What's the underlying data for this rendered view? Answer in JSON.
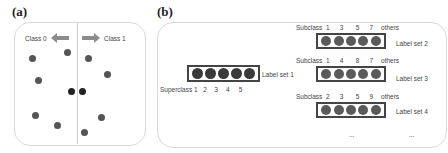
{
  "panel_a": {
    "label": "(a)",
    "class0_label": "Class 0",
    "class1_label": "Class 1",
    "arrow_left": "left-arrow",
    "arrow_right": "right-arrow",
    "points_left": 6,
    "points_right": 6,
    "boundary_points": 2
  },
  "panel_b": {
    "label": "(b)",
    "superclass": {
      "prefix": "Superclass",
      "numbers": [
        "1",
        "2",
        "3",
        "4",
        "5"
      ],
      "set_label": "Label set 1"
    },
    "subsets": [
      {
        "prefix": "Subclass",
        "numbers": [
          "1",
          "3",
          "5",
          "7",
          "others"
        ],
        "set_label": "Label set 2"
      },
      {
        "prefix": "Subclass",
        "numbers": [
          "1",
          "4",
          "8",
          "7",
          "others"
        ],
        "set_label": "Label set 3"
      },
      {
        "prefix": "Subclass",
        "numbers": [
          "2",
          "3",
          "5",
          "9",
          "others"
        ],
        "set_label": "Label set 4"
      }
    ],
    "ellipsis_1": "...",
    "ellipsis_2": "..."
  },
  "colors": {
    "dot": "#555555",
    "dark_dot": "#222222",
    "arrow": "#8c8c8c",
    "border": "#d9d9d9"
  }
}
